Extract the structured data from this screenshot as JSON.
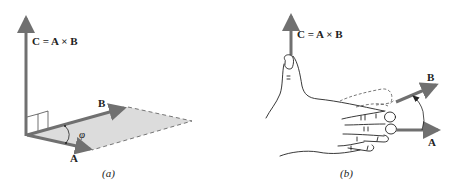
{
  "diagram": {
    "panel_a": {
      "caption": "(a)",
      "label_c": "C = A × B",
      "label_a": "A",
      "label_b": "B",
      "label_angle": "φ"
    },
    "panel_b": {
      "caption": "(b)",
      "label_c": "C = A × B",
      "label_a": "A",
      "label_b": "B"
    },
    "colors": {
      "vector": "#707070",
      "plane": "#d9d9d9",
      "ink": "#222222"
    }
  }
}
